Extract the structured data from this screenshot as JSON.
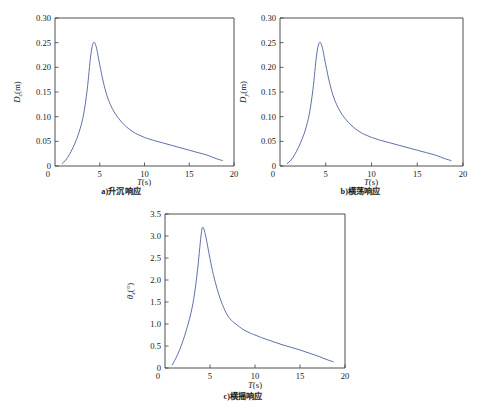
{
  "figure": {
    "background_color": "#ffffff",
    "curve_color": "#4e5fa0",
    "axis_color": "#3a3a3a",
    "text_color": "#1a1a1a"
  },
  "panels": [
    {
      "id": "panel-a",
      "caption": "a)升沉响应",
      "xlabel_symbol": "T",
      "xlabel_unit": "(s)",
      "ylabel_symbol": "D",
      "ylabel_subscript": "z",
      "ylabel_unit": "(m)"
    },
    {
      "id": "panel-b",
      "caption": "b)横荡响应",
      "xlabel_symbol": "T",
      "xlabel_unit": "(s)",
      "ylabel_symbol": "D",
      "ylabel_subscript": "y",
      "ylabel_unit": "(m)"
    },
    {
      "id": "panel-c",
      "caption": "c)横摇响应",
      "xlabel_symbol": "T",
      "xlabel_unit": "(s)",
      "ylabel_symbol": "θ",
      "ylabel_subscript": "x",
      "ylabel_unit": "(°)"
    }
  ],
  "chart_data": [
    {
      "type": "line",
      "id": "panel-a",
      "title": "a)升沉响应",
      "xlabel": "T(s)",
      "ylabel": "Dz(m)",
      "xlim": [
        0,
        20
      ],
      "ylim": [
        0,
        0.3
      ],
      "xticks": [
        0,
        5,
        10,
        15,
        20
      ],
      "xtick_labels": [
        "0",
        "5",
        "10",
        "15",
        "20"
      ],
      "yticks": [
        0,
        0.05,
        0.1,
        0.15,
        0.2,
        0.25,
        0.3
      ],
      "ytick_labels": [
        "0",
        "0.05",
        "0.10",
        "0.15",
        "0.20",
        "0.25",
        "0.30"
      ],
      "grid": false,
      "legend": "none",
      "series": [
        {
          "name": "heave RAO",
          "color": "#4e5fa0",
          "x": [
            0.8,
            1.2,
            1.6,
            2.0,
            2.4,
            2.8,
            3.2,
            3.6,
            4.0,
            4.3,
            4.6,
            5.0,
            5.4,
            5.8,
            6.2,
            6.6,
            7.0,
            7.5,
            8.0,
            8.5,
            9.0,
            9.5,
            10.0,
            11.0,
            12.0,
            13.0,
            14.0,
            15.0,
            16.0,
            17.0,
            18.0,
            18.7
          ],
          "y": [
            0.005,
            0.012,
            0.023,
            0.037,
            0.054,
            0.075,
            0.105,
            0.155,
            0.225,
            0.25,
            0.242,
            0.205,
            0.17,
            0.143,
            0.124,
            0.11,
            0.099,
            0.088,
            0.079,
            0.072,
            0.066,
            0.062,
            0.058,
            0.052,
            0.047,
            0.042,
            0.037,
            0.032,
            0.027,
            0.022,
            0.015,
            0.011
          ]
        }
      ]
    },
    {
      "type": "line",
      "id": "panel-b",
      "title": "b)横荡响应",
      "xlabel": "T(s)",
      "ylabel": "Dy(m)",
      "xlim": [
        0,
        20
      ],
      "ylim": [
        0,
        0.3
      ],
      "xticks": [
        0,
        5,
        10,
        15,
        20
      ],
      "xtick_labels": [
        "0",
        "5",
        "10",
        "15",
        "20"
      ],
      "yticks": [
        0,
        0.05,
        0.1,
        0.15,
        0.2,
        0.25,
        0.3
      ],
      "ytick_labels": [
        "0",
        "0.05",
        "0.10",
        "0.15",
        "0.20",
        "0.25",
        "0.30"
      ],
      "grid": false,
      "legend": "none",
      "series": [
        {
          "name": "sway RAO",
          "color": "#4e5fa0",
          "x": [
            0.8,
            1.2,
            1.6,
            2.0,
            2.4,
            2.8,
            3.2,
            3.6,
            4.0,
            4.3,
            4.6,
            5.0,
            5.4,
            5.8,
            6.2,
            6.6,
            7.0,
            7.5,
            8.0,
            8.5,
            9.0,
            9.5,
            10.0,
            11.0,
            12.0,
            13.0,
            14.0,
            15.0,
            16.0,
            17.0,
            18.0,
            18.7
          ],
          "y": [
            0.005,
            0.012,
            0.023,
            0.037,
            0.054,
            0.075,
            0.105,
            0.155,
            0.225,
            0.25,
            0.242,
            0.205,
            0.17,
            0.143,
            0.124,
            0.11,
            0.099,
            0.088,
            0.079,
            0.072,
            0.066,
            0.062,
            0.058,
            0.052,
            0.047,
            0.042,
            0.037,
            0.032,
            0.027,
            0.022,
            0.015,
            0.011
          ]
        }
      ]
    },
    {
      "type": "line",
      "id": "panel-c",
      "title": "c)横摇响应",
      "xlabel": "T(s)",
      "ylabel": "θx(°)",
      "xlim": [
        0,
        20
      ],
      "ylim": [
        0,
        3.5
      ],
      "xticks": [
        0,
        5,
        10,
        15,
        20
      ],
      "xtick_labels": [
        "0",
        "5",
        "10",
        "15",
        "20"
      ],
      "yticks": [
        0,
        0.5,
        1.0,
        1.5,
        2.0,
        2.5,
        3.0,
        3.5
      ],
      "ytick_labels": [
        "0",
        "0.5",
        "1.0",
        "1.5",
        "2.0",
        "2.5",
        "3.0",
        "3.5"
      ],
      "grid": false,
      "legend": "none",
      "series": [
        {
          "name": "roll RAO",
          "color": "#4e5fa0",
          "x": [
            0.8,
            1.2,
            1.6,
            2.0,
            2.4,
            2.8,
            3.2,
            3.6,
            4.0,
            4.2,
            4.5,
            4.8,
            5.2,
            5.6,
            6.0,
            6.5,
            7.0,
            7.5,
            8.0,
            8.5,
            9.0,
            9.5,
            10.0,
            11.0,
            12.0,
            13.0,
            14.0,
            15.0,
            16.0,
            17.0,
            18.0,
            18.7
          ],
          "y": [
            0.07,
            0.22,
            0.4,
            0.62,
            0.88,
            1.18,
            1.58,
            2.2,
            3.0,
            3.2,
            3.02,
            2.7,
            2.28,
            1.94,
            1.66,
            1.38,
            1.18,
            1.06,
            0.98,
            0.9,
            0.84,
            0.79,
            0.75,
            0.67,
            0.6,
            0.53,
            0.47,
            0.41,
            0.34,
            0.27,
            0.19,
            0.14
          ]
        }
      ]
    }
  ]
}
